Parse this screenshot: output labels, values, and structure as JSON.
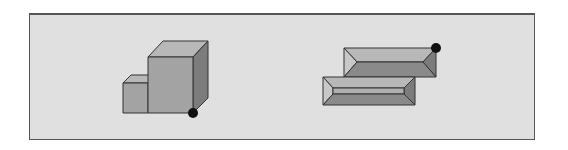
{
  "figure": {
    "colors": {
      "background": "#e0e0e0",
      "frame_border": "#555555",
      "face_front": "#a3a3a3",
      "face_top": "#b8b8b8",
      "face_side": "#7c7c7c",
      "face_dark": "#8a8a8a",
      "edge": "#333333",
      "marker": "#111111"
    },
    "left_shape": {
      "name": "stacked-cubes",
      "marker": {
        "x": 193,
        "y": 113,
        "r": 5
      }
    },
    "right_shape": {
      "name": "beveled-slabs",
      "marker": {
        "x": 436,
        "y": 48,
        "r": 5
      }
    }
  }
}
